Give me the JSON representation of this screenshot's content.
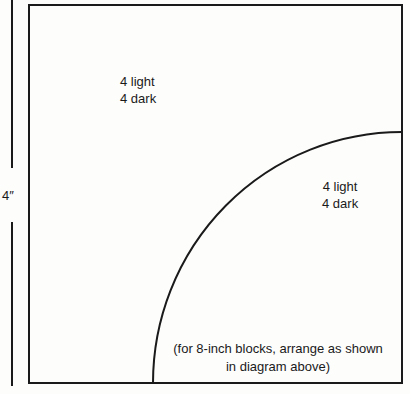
{
  "diagram": {
    "dimension": {
      "label": "4″"
    },
    "regions": [
      {
        "name": "outer-region",
        "line1": "4 light",
        "line2": "4 dark"
      },
      {
        "name": "arc-region",
        "line1": "4 light",
        "line2": "4 dark"
      }
    ],
    "caption": {
      "line1": "(for 8-inch blocks, arrange as shown",
      "line2": "in diagram above)"
    },
    "colors": {
      "line": "#1a1a1a",
      "background": "#fdfdfc"
    }
  }
}
